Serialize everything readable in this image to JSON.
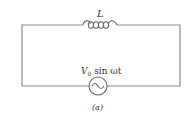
{
  "diagram": {
    "type": "circuit",
    "inductor_label": "L",
    "source_label_main": "V",
    "source_label_sub": "0",
    "source_label_rest": " sin ωt",
    "caption": "(a)",
    "wire_color": "#8a8a8a"
  }
}
